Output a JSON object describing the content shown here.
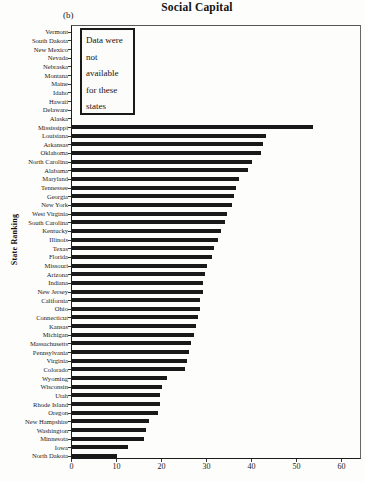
{
  "title": "Social Capital",
  "subfigure_label": "(b)",
  "note": {
    "text": "Data were not available for these states",
    "lines": [
      "Data were",
      "not",
      "available",
      "for these",
      "states"
    ]
  },
  "colors": {
    "bar": "#191919",
    "background": "#fdfdfc",
    "axis": "#1c1c1c",
    "text": "#1b1b1b"
  },
  "chart_data": {
    "type": "bar",
    "orientation": "horizontal",
    "title": "Social Capital",
    "xlabel": "",
    "ylabel": "State Ranking",
    "xlim": [
      0,
      60
    ],
    "x_ticks": [
      0,
      10,
      20,
      30,
      40,
      50,
      60
    ],
    "grid": false,
    "legend": false,
    "annotation": "Data were not available for these states",
    "categories": [
      "Vermont",
      "South Dakota",
      "New Mexico",
      "Nevada",
      "Nebraska",
      "Montana",
      "Maine",
      "Idaho",
      "Hawaii",
      "Delaware",
      "Alaska",
      "Mississippi",
      "Louisiana",
      "Arkansas",
      "Oklahoma",
      "North Carolina",
      "Alabama",
      "Maryland",
      "Tennessee",
      "Georgia",
      "New York",
      "West Virginia",
      "South Carolina",
      "Kentucky",
      "Illinois",
      "Texas",
      "Florida",
      "Missouri",
      "Arizona",
      "Indiana",
      "New Jersey",
      "California",
      "Ohio",
      "Connecticut",
      "Kansas",
      "Michigan",
      "Massachusetts",
      "Pennsylvania",
      "Virginia",
      "Colorado",
      "Wyoming",
      "Wisconsin",
      "Utah",
      "Rhode Island",
      "Oregon",
      "New Hampshire",
      "Washington",
      "Minnesota",
      "Iowa",
      "North Dakota"
    ],
    "values": [
      null,
      null,
      null,
      null,
      null,
      null,
      null,
      null,
      null,
      null,
      null,
      53.5,
      43,
      42.5,
      42,
      40,
      39,
      37,
      36.5,
      36,
      35.5,
      34.5,
      34,
      33,
      32.5,
      31.5,
      31,
      30,
      29.5,
      29,
      29,
      28.5,
      28.5,
      28,
      27.5,
      27,
      26.5,
      26,
      25.5,
      25,
      21,
      20,
      19.5,
      19.5,
      19,
      17,
      16.5,
      16,
      12.5,
      10
    ]
  }
}
